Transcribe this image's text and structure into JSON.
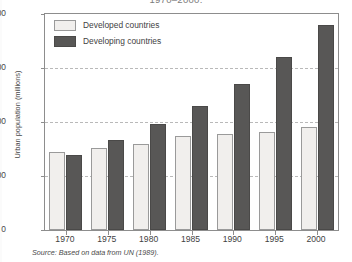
{
  "figure": {
    "title": "1970–2000.",
    "source_note": "Source: Based on data from UN (1989)."
  },
  "legend": {
    "position": "top-left-inside",
    "entries": [
      {
        "label": "Developed countries",
        "swatch": "light-swatch",
        "color": "#f1efed"
      },
      {
        "label": "Developing countries",
        "swatch": "dark-swatch",
        "color": "#585756"
      }
    ]
  },
  "axes": {
    "y": {
      "label": "Urban population (millions)",
      "ticks": [
        "0",
        "500",
        "1000",
        "1500",
        "2000"
      ],
      "min": 0,
      "max": 2000
    },
    "x": {
      "label": "",
      "ticks": [
        "1970",
        "1975",
        "1980",
        "1985",
        "1990",
        "1995",
        "2000"
      ]
    }
  },
  "chart_data": {
    "type": "bar",
    "title": "1970–2000.",
    "xlabel": "",
    "ylabel": "Urban population (millions)",
    "ylim": [
      0,
      2000
    ],
    "ytick_step": 500,
    "grid": "horizontal-dashed",
    "legend_position": "top-left-inside",
    "categories": [
      "1970",
      "1975",
      "1980",
      "1985",
      "1990",
      "1995",
      "2000"
    ],
    "series": [
      {
        "name": "Developed countries",
        "color": "#f1efed",
        "values": [
          720,
          760,
          800,
          870,
          890,
          910,
          950
        ]
      },
      {
        "name": "Developing countries",
        "color": "#585756",
        "values": [
          690,
          830,
          980,
          1150,
          1350,
          1600,
          1900
        ]
      }
    ],
    "annotations": [
      "Source: Based on data from UN (1989)."
    ]
  }
}
